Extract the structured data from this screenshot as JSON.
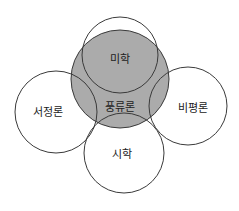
{
  "diagram": {
    "type": "venn-overlap",
    "colors": {
      "core_fill": "#ababab",
      "stroke": "#3a3a3a",
      "text": "#222222",
      "background": "#ffffff"
    },
    "core": {
      "label": "풍류론",
      "cx": 120,
      "cy": 79,
      "r": 49
    },
    "circles": [
      {
        "id": "top",
        "label": "미학",
        "cx": 120,
        "cy": 55,
        "r": 38,
        "label_x": 120,
        "label_y": 60
      },
      {
        "id": "left",
        "label": "서정론",
        "cx": 56,
        "cy": 112,
        "r": 41,
        "label_x": 48,
        "label_y": 113
      },
      {
        "id": "right",
        "label": "비평론",
        "cx": 188,
        "cy": 106,
        "r": 39,
        "label_x": 193,
        "label_y": 109
      },
      {
        "id": "bottom",
        "label": "시학",
        "cx": 124,
        "cy": 153,
        "r": 40,
        "label_x": 122,
        "label_y": 155
      }
    ],
    "core_label_pos": {
      "x": 120,
      "y": 108
    }
  }
}
